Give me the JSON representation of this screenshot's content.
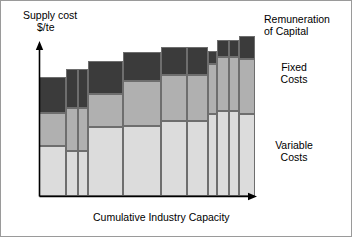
{
  "figure": {
    "background": "#ffffff",
    "border_color": "#9a9a9a",
    "width": 352,
    "height": 237
  },
  "axes": {
    "y_title_line1": "Supply cost",
    "y_title_line2": "$/te",
    "x_title": "Cumulative Industry Capacity",
    "origin_x": 38,
    "origin_y": 195,
    "y_top": 42,
    "x_right": 255,
    "axis_color": "#000000"
  },
  "legend": {
    "position": "right",
    "items": [
      {
        "key": "remuneration",
        "label": "Remuneration\nof Capital",
        "color": "#3b3b3b"
      },
      {
        "key": "fixed",
        "label": "Fixed\nCosts",
        "color": "#b0b0b0"
      },
      {
        "key": "variable",
        "label": "Variable\nCosts",
        "color": "#dcdcdc"
      }
    ]
  },
  "chart_data": {
    "type": "bar",
    "subtype": "stacked-width-varying-cost-curve",
    "title": "",
    "xlabel": "Cumulative Industry Capacity",
    "ylabel": "Supply cost $/te",
    "grid": false,
    "legend_position": "right",
    "axis_labels_shown": false,
    "xlim": [
      0,
      100
    ],
    "ylim": [
      0,
      100
    ],
    "series": [
      {
        "name": "Variable Costs",
        "color": "#dcdcdc",
        "values": [
          39,
          37,
          37,
          57,
          53,
          53,
          57,
          65,
          65,
          61
        ]
      },
      {
        "name": "Fixed Costs",
        "color": "#b0b0b0",
        "values": [
          16,
          19,
          30,
          17,
          26,
          26,
          31,
          25,
          25,
          32
        ]
      },
      {
        "name": "Remuneration of Capital",
        "color": "#3b3b3b",
        "values": [
          21,
          23,
          19,
          16,
          17,
          17,
          9,
          17,
          17,
          14
        ]
      }
    ],
    "bars": [
      {
        "index": 1,
        "x_start": 0.0,
        "width": 13.0,
        "variable": 39,
        "fixed": 16,
        "remuneration": 21,
        "total": 76
      },
      {
        "index": 2,
        "x_start": 13.0,
        "width": 6.0,
        "variable": 37,
        "fixed": 19,
        "remuneration": 23,
        "total": 79
      },
      {
        "index": 3,
        "x_start": 19.0,
        "width": 4.5,
        "variable": 37,
        "fixed": 19,
        "remuneration": 23,
        "total": 79
      },
      {
        "index": 4,
        "x_start": 23.5,
        "width": 16.0,
        "variable": 37,
        "fixed": 30,
        "remuneration": 19,
        "total": 86
      },
      {
        "index": 5,
        "x_start": 39.5,
        "width": 17.5,
        "variable": 57,
        "fixed": 17,
        "remuneration": 16,
        "total": 90
      },
      {
        "index": 6,
        "x_start": 57.0,
        "width": 12.0,
        "variable": 53,
        "fixed": 26,
        "remuneration": 17,
        "total": 96
      },
      {
        "index": 7,
        "x_start": 69.0,
        "width": 9.5,
        "variable": 53,
        "fixed": 26,
        "remuneration": 17,
        "total": 96
      },
      {
        "index": 8,
        "x_start": 78.5,
        "width": 4.0,
        "variable": 57,
        "fixed": 31,
        "remuneration": 9,
        "total": 97
      },
      {
        "index": 9,
        "x_start": 82.5,
        "width": 5.5,
        "variable": 65,
        "fixed": 25,
        "remuneration": 17,
        "total": 107
      },
      {
        "index": 10,
        "x_start": 88.0,
        "width": 4.5,
        "variable": 65,
        "fixed": 25,
        "remuneration": 17,
        "total": 107
      },
      {
        "index": 11,
        "x_start": 92.5,
        "width": 7.5,
        "variable": 61,
        "fixed": 32,
        "remuneration": 14,
        "total": 107
      }
    ]
  },
  "bar_geometry": [
    {
      "name": "bar-1",
      "left": 38,
      "width": 27,
      "top": 76,
      "seg_variable_top": 145,
      "seg_fixed_top": 112
    },
    {
      "name": "bar-2",
      "left": 65,
      "width": 12,
      "top": 68,
      "seg_variable_top": 150,
      "seg_fixed_top": 107
    },
    {
      "name": "bar-3",
      "left": 77,
      "width": 10,
      "top": 68,
      "seg_variable_top": 150,
      "seg_fixed_top": 107
    },
    {
      "name": "bar-4",
      "left": 87,
      "width": 35,
      "top": 60,
      "seg_variable_top": 126,
      "seg_fixed_top": 93
    },
    {
      "name": "bar-5",
      "left": 122,
      "width": 38,
      "top": 51,
      "seg_variable_top": 125,
      "seg_fixed_top": 80
    },
    {
      "name": "bar-6",
      "left": 160,
      "width": 26,
      "top": 46,
      "seg_variable_top": 120,
      "seg_fixed_top": 74
    },
    {
      "name": "bar-7",
      "left": 186,
      "width": 21,
      "top": 46,
      "seg_variable_top": 120,
      "seg_fixed_top": 74
    },
    {
      "name": "bar-8",
      "left": 207,
      "width": 9,
      "top": 50,
      "seg_variable_top": 113,
      "seg_fixed_top": 63
    },
    {
      "name": "bar-9",
      "left": 216,
      "width": 12,
      "top": 39,
      "seg_variable_top": 110,
      "seg_fixed_top": 56
    },
    {
      "name": "bar-10",
      "left": 228,
      "width": 10,
      "top": 39,
      "seg_variable_top": 110,
      "seg_fixed_top": 56
    },
    {
      "name": "bar-11",
      "left": 238,
      "width": 16,
      "top": 35,
      "seg_variable_top": 113,
      "seg_fixed_top": 58
    }
  ]
}
